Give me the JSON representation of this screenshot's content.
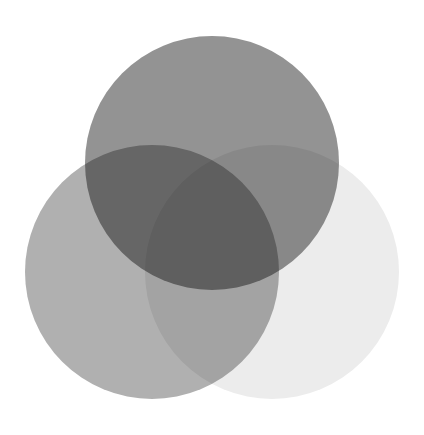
{
  "figure": {
    "title": "",
    "background_color": "#ffffff",
    "width": 424,
    "height": 435
  },
  "chart_data": {
    "type": "venn",
    "title": "",
    "subtitle": "",
    "xlabel": "",
    "ylabel": "",
    "grid": false,
    "legend_position": "none",
    "background_color": "#ffffff",
    "blend_mode": "multiply",
    "set_count": 3,
    "sets": [
      {
        "id": "set-a",
        "label": "",
        "position": "top",
        "center_x": 212,
        "center_y": 163,
        "radius": 127,
        "fill_color": "#939393",
        "opacity": 1.0
      },
      {
        "id": "set-b",
        "label": "",
        "position": "bottom-left",
        "center_x": 152,
        "center_y": 272,
        "radius": 127,
        "fill_color": "#b0b0b0",
        "opacity": 1.0
      },
      {
        "id": "set-c",
        "label": "",
        "position": "bottom-right",
        "center_x": 272,
        "center_y": 272,
        "radius": 127,
        "fill_color": "#ececec",
        "opacity": 1.0
      }
    ],
    "regions": [
      {
        "id": "only-a",
        "sets": [
          "set-a"
        ],
        "observed_color": "#939393",
        "label": ""
      },
      {
        "id": "only-b",
        "sets": [
          "set-b"
        ],
        "observed_color": "#8f8f8f",
        "label": ""
      },
      {
        "id": "only-c",
        "sets": [
          "set-c"
        ],
        "observed_color": "#ececec",
        "label": ""
      },
      {
        "id": "a-and-b",
        "sets": [
          "set-a",
          "set-b"
        ],
        "observed_color": "#4a4a4a",
        "label": ""
      },
      {
        "id": "a-and-c",
        "sets": [
          "set-a",
          "set-c"
        ],
        "observed_color": "#8e8e8e",
        "label": ""
      },
      {
        "id": "b-and-c",
        "sets": [
          "set-b",
          "set-c"
        ],
        "observed_color": "#909090",
        "label": ""
      },
      {
        "id": "a-b-and-c",
        "sets": [
          "set-a",
          "set-b",
          "set-c"
        ],
        "observed_color": "#3a3a3a",
        "label": ""
      }
    ]
  }
}
